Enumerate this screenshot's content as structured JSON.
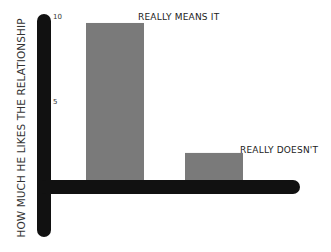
{
  "chart_data": {
    "type": "bar",
    "title": "",
    "xlabel": "",
    "ylabel": "HOW MUCH HE LIKES THE RELATIONSHIP",
    "categories": [
      "REALLY MEANS IT",
      "REALLY DOESN'T"
    ],
    "values": [
      9.3,
      1.7
    ],
    "ylim": [
      0,
      10
    ],
    "yticks": [
      "5",
      "10"
    ],
    "grid": false,
    "legend": null,
    "bar_color": "#7a7a7a",
    "axis_color": "#111111",
    "annotations": [
      {
        "text": "REALLY MEANS IT",
        "target": 0
      },
      {
        "text": "REALLY DOESN'T",
        "target": 1
      }
    ]
  }
}
